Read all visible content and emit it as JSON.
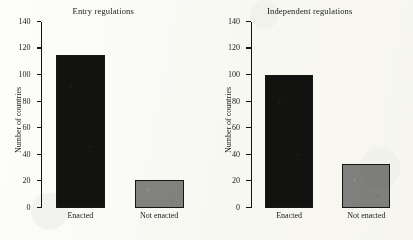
{
  "figure": {
    "background_color": "#fdfdfb",
    "bar_dark_color": "#121210",
    "bar_gray_color": "#838383",
    "axis_color": "#15150f"
  },
  "chart_data": [
    {
      "type": "bar",
      "title": "Entry regulations",
      "xlabel": "",
      "ylabel": "Number of countries",
      "categories": [
        "Enacted",
        "Not enacted"
      ],
      "values": [
        115,
        21
      ],
      "colors": [
        "#121210",
        "#838383"
      ],
      "ylim": [
        0,
        140
      ],
      "yticks": [
        0,
        20,
        40,
        60,
        80,
        100,
        120,
        140
      ],
      "ytick_labels": [
        "0",
        "20",
        "40",
        "60",
        "80",
        "100",
        "120",
        "140"
      ],
      "grid": false,
      "legend": false
    },
    {
      "type": "bar",
      "title": "Independent regulations",
      "xlabel": "",
      "ylabel": "Number of countries",
      "categories": [
        "Enacted",
        "Not enacted"
      ],
      "values": [
        100,
        33
      ],
      "colors": [
        "#121210",
        "#838383"
      ],
      "ylim": [
        0,
        140
      ],
      "yticks": [
        0,
        20,
        40,
        60,
        80,
        100,
        120,
        140
      ],
      "ytick_labels": [
        "0",
        "20",
        "40",
        "60",
        "80",
        "100",
        "120",
        "140"
      ],
      "grid": false,
      "legend": false
    }
  ]
}
